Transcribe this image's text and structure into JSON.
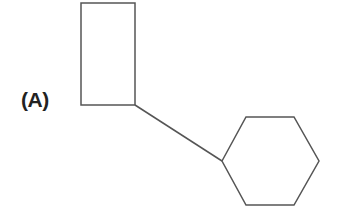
{
  "label": "(A)",
  "shapes": {
    "rectangle": {
      "x": 81,
      "y": 3,
      "width": 54,
      "height": 102
    },
    "connector": {
      "x1": 135,
      "y1": 105,
      "x2": 222,
      "y2": 161
    },
    "hexagon": {
      "points": "222,161 246,117 294,117 319,161 294,205 246,205"
    }
  },
  "colors": {
    "stroke": "#555555"
  }
}
